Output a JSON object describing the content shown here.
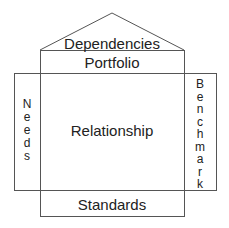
{
  "diagram": {
    "type": "house-framework",
    "roof": {
      "label": "Dependencies"
    },
    "top_band": {
      "label": "Portfolio"
    },
    "center": {
      "label": "Relationship"
    },
    "left_pillar": {
      "label": "Needs",
      "letters": [
        "N",
        "e",
        "e",
        "d",
        "s"
      ]
    },
    "right_pillar": {
      "label": "Benchmark",
      "letters": [
        "B",
        "e",
        "n",
        "c",
        "h",
        "m",
        "a",
        "r",
        "k"
      ]
    },
    "foundation": {
      "label": "Standards"
    }
  },
  "colors": {
    "line": "#555555",
    "text": "#222222",
    "background": "#ffffff"
  }
}
